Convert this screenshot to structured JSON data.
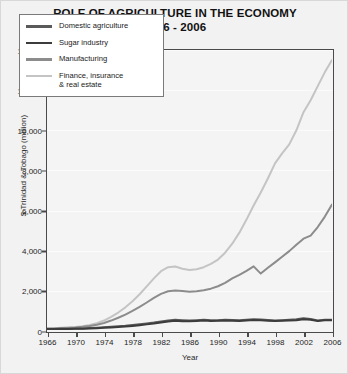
{
  "chart_data": {
    "type": "line",
    "title": "ROLE OF AGRICULTURE IN THE ECONOMY",
    "subtitle": "1966 - 2006",
    "xlabel": "Year",
    "ylabel": "$ Trinidad & Tobago (million)",
    "xlim": [
      1966,
      2006
    ],
    "ylim": [
      0,
      14000
    ],
    "xticks": [
      1966,
      1970,
      1974,
      1978,
      1982,
      1986,
      1990,
      1994,
      1998,
      2002,
      2006
    ],
    "yticks": [
      0,
      2000,
      4000,
      6000,
      8000,
      10000,
      12000,
      14000
    ],
    "ytick_labels": [
      "0",
      "2,000",
      "4,000",
      "6,000",
      "8,000",
      "10,000",
      "12,000",
      "14,000"
    ],
    "xtick_labels": [
      "1966",
      "1970",
      "1974",
      "1978",
      "1982",
      "1986",
      "1990",
      "1994",
      "1998",
      "2002",
      "2006"
    ],
    "grid": true,
    "legend_position": "top-left",
    "x": [
      1966,
      1967,
      1968,
      1969,
      1970,
      1971,
      1972,
      1973,
      1974,
      1975,
      1976,
      1977,
      1978,
      1979,
      1980,
      1981,
      1982,
      1983,
      1984,
      1985,
      1986,
      1987,
      1988,
      1989,
      1990,
      1991,
      1992,
      1993,
      1994,
      1995,
      1996,
      1997,
      1998,
      1999,
      2000,
      2001,
      2002,
      2003,
      2004,
      2005,
      2006
    ],
    "series": [
      {
        "name": "Domestic agriculture",
        "color": "#5a5a5a",
        "width": 2.0,
        "values": [
          100,
          105,
          110,
          115,
          120,
          130,
          145,
          165,
          190,
          215,
          240,
          265,
          300,
          340,
          380,
          420,
          470,
          520,
          560,
          540,
          520,
          540,
          560,
          530,
          540,
          560,
          545,
          530,
          560,
          590,
          575,
          545,
          520,
          540,
          560,
          580,
          640,
          600,
          520,
          560,
          560
        ]
      },
      {
        "name": "Sugar industry",
        "color": "#3c3c3c",
        "width": 2.0,
        "values": [
          95,
          98,
          100,
          103,
          108,
          115,
          125,
          140,
          160,
          180,
          200,
          225,
          255,
          290,
          330,
          370,
          420,
          470,
          505,
          490,
          480,
          500,
          520,
          500,
          505,
          520,
          510,
          500,
          520,
          545,
          535,
          515,
          495,
          510,
          525,
          540,
          590,
          560,
          500,
          530,
          530
        ]
      },
      {
        "name": "Manufacturing",
        "color": "#8c8c8c",
        "width": 2.0,
        "values": [
          120,
          130,
          145,
          160,
          180,
          210,
          250,
          310,
          400,
          520,
          660,
          820,
          1000,
          1200,
          1420,
          1650,
          1850,
          1980,
          2020,
          1990,
          1960,
          1980,
          2030,
          2110,
          2230,
          2400,
          2620,
          2800,
          3000,
          3220,
          2860,
          3150,
          3420,
          3700,
          3980,
          4300,
          4600,
          4750,
          5180,
          5700,
          6300
        ]
      },
      {
        "name": "Finance, insurance\n& real estate",
        "color": "#c4c4c4",
        "width": 2.0,
        "values": [
          130,
          142,
          158,
          175,
          200,
          240,
          300,
          390,
          520,
          700,
          920,
          1180,
          1480,
          1830,
          2220,
          2620,
          2980,
          3180,
          3210,
          3100,
          3040,
          3080,
          3180,
          3340,
          3560,
          3900,
          4350,
          4900,
          5550,
          6250,
          6900,
          7600,
          8350,
          8850,
          9300,
          10000,
          10900,
          11500,
          12200,
          12900,
          13500
        ]
      }
    ]
  },
  "legend": {
    "items": [
      {
        "label": "Domestic agriculture"
      },
      {
        "label": "Sugar industry"
      },
      {
        "label": "Manufacturing"
      },
      {
        "label": "Finance, insurance\n& real estate"
      }
    ]
  }
}
